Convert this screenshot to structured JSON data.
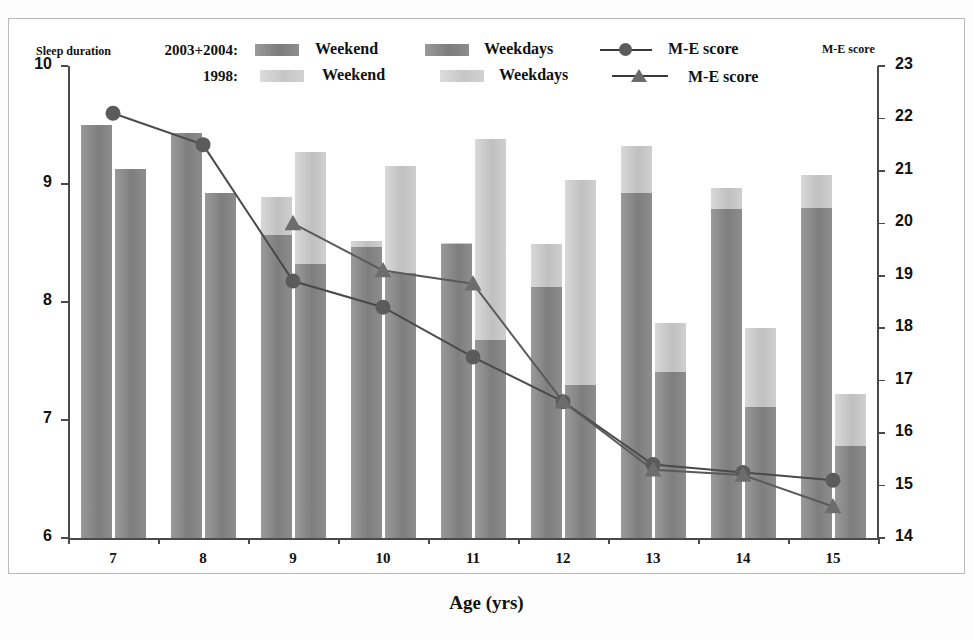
{
  "axes": {
    "left_title": "Sleep duration",
    "right_title": "M-E score",
    "x_title": "Age (yrs)",
    "left_ticks": [
      "10",
      "9",
      "8",
      "7",
      "6"
    ],
    "right_ticks": [
      "23",
      "22",
      "21",
      "20",
      "19",
      "18",
      "17",
      "16",
      "15",
      "14"
    ],
    "x_ticks": [
      "7",
      "8",
      "9",
      "10",
      "11",
      "12",
      "13",
      "14",
      "15"
    ]
  },
  "legend": {
    "group_2003": "2003+2004:",
    "group_1998": "1998:",
    "weekend_2003": "Weekend",
    "weekdays_2003": "Weekdays",
    "me_2003": "M-E score",
    "weekend_1998": "Weekend",
    "weekdays_1998": "Weekdays",
    "me_1998": "M-E score",
    "color_dark": "#8a8a8a",
    "color_light": "#c9c9c9",
    "color_line": "#4a4a4a"
  },
  "chart_data": {
    "type": "bar",
    "title": "",
    "xlabel": "Age (yrs)",
    "ylabel": "Sleep duration",
    "y2label": "M-E score",
    "ylim": [
      6,
      10
    ],
    "y2lim": [
      14,
      23
    ],
    "grid": false,
    "legend_position": "top",
    "categories": [
      "7",
      "8",
      "9",
      "10",
      "11",
      "12",
      "13",
      "14",
      "15"
    ],
    "series": [
      {
        "name": "Weekend 2003+2004",
        "axis": "left",
        "kind": "bar",
        "color": "#8a8a8a",
        "values": [
          9.5,
          9.43,
          8.57,
          8.47,
          8.49,
          8.13,
          8.92,
          8.79,
          8.8
        ]
      },
      {
        "name": "Weekend 1998",
        "axis": "left",
        "kind": "bar",
        "color": "#c9c9c9",
        "values": [
          9.2,
          9.2,
          8.89,
          8.52,
          8.5,
          8.49,
          9.32,
          8.97,
          9.08
        ]
      },
      {
        "name": "Weekdays 2003+2004",
        "axis": "left",
        "kind": "bar",
        "color": "#8a8a8a",
        "values": [
          9.13,
          8.92,
          8.32,
          8.25,
          7.68,
          7.3,
          7.41,
          7.11,
          6.78
        ]
      },
      {
        "name": "Weekdays 1998",
        "axis": "left",
        "kind": "bar",
        "color": "#c9c9c9",
        "values": [
          8.9,
          8.7,
          9.27,
          9.15,
          9.38,
          9.03,
          7.82,
          7.78,
          7.22
        ]
      },
      {
        "name": "M-E score 2003+2004",
        "axis": "right",
        "kind": "line",
        "marker": "circle",
        "color": "#4a4a4a",
        "values": [
          22.1,
          21.5,
          18.9,
          18.4,
          17.45,
          16.6,
          15.4,
          15.25,
          15.1
        ]
      },
      {
        "name": "M-E score 1998",
        "axis": "right",
        "kind": "line",
        "marker": "triangle",
        "color": "#5a5a5a",
        "values": [
          null,
          null,
          20.0,
          19.1,
          18.85,
          16.6,
          15.3,
          15.2,
          14.6
        ]
      }
    ]
  }
}
